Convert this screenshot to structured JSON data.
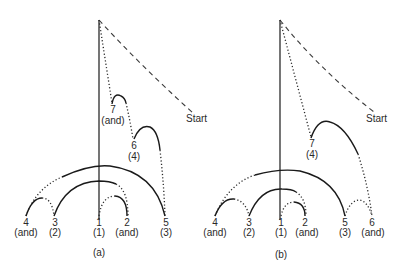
{
  "figure": {
    "panels": [
      {
        "id": "a",
        "caption": "(a)",
        "start_label": "Start",
        "nodes": [
          {
            "num": "4",
            "role": "(and)"
          },
          {
            "num": "3",
            "role": "(2)"
          },
          {
            "num": "1",
            "role": "(1)"
          },
          {
            "num": "2",
            "role": "(and)"
          },
          {
            "num": "5",
            "role": "(3)"
          },
          {
            "num": "7",
            "role": "(and)"
          },
          {
            "num": "6",
            "role": "(4)"
          }
        ]
      },
      {
        "id": "b",
        "caption": "(b)",
        "start_label": "Start",
        "nodes": [
          {
            "num": "4",
            "role": "(and)"
          },
          {
            "num": "3",
            "role": "(2)"
          },
          {
            "num": "1",
            "role": "(1)"
          },
          {
            "num": "2",
            "role": "(and)"
          },
          {
            "num": "5",
            "role": "(3)"
          },
          {
            "num": "6",
            "role": "(and)"
          },
          {
            "num": "7",
            "role": "(4)"
          }
        ]
      }
    ],
    "line_styles": {
      "solid": "#1a1a1a",
      "dotted": "#2a2a2a",
      "dashed": "#3a3a3a"
    }
  }
}
